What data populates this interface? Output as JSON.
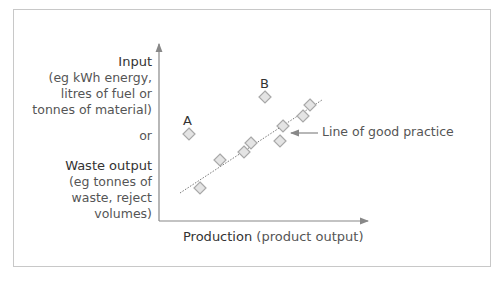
{
  "diagram": {
    "y_axis": {
      "input_title": "Input",
      "input_lines": [
        "(eg kWh energy,",
        "litres of fuel or",
        "tonnes of material)"
      ],
      "or_label": "or",
      "waste_title": "Waste output",
      "waste_lines": [
        "(eg tonnes of",
        "waste, reject",
        "volumes)"
      ]
    },
    "x_axis": {
      "title": "Production",
      "subtitle": "(product output)"
    },
    "trend_line_label": "Line of good practice",
    "outlier_labels": {
      "a": "A",
      "b": "B"
    },
    "colors": {
      "axis": "#888888",
      "marker_fill": "#e4e4e4",
      "marker_stroke": "#a8a8a8",
      "trend_line": "#777777",
      "frame": "#c8c8c8"
    }
  },
  "chart_data": {
    "type": "scatter",
    "title": "",
    "xlabel": "Production (product output)",
    "ylabel": "Input or Waste output",
    "points": [
      {
        "label": "A",
        "x": 189,
        "y": 134
      },
      {
        "label": "B",
        "x": 265,
        "y": 97
      },
      {
        "label": "",
        "x": 200,
        "y": 188
      },
      {
        "label": "",
        "x": 220,
        "y": 160
      },
      {
        "label": "",
        "x": 244,
        "y": 152
      },
      {
        "label": "",
        "x": 251,
        "y": 143
      },
      {
        "label": "",
        "x": 280,
        "y": 141
      },
      {
        "label": "",
        "x": 283,
        "y": 126
      },
      {
        "label": "",
        "x": 303,
        "y": 116
      },
      {
        "label": "",
        "x": 310,
        "y": 105
      }
    ],
    "trend_line": {
      "x1": 180,
      "y1": 193,
      "x2": 322,
      "y2": 100,
      "style": "dotted",
      "label": "Line of good practice"
    },
    "grid": false
  }
}
